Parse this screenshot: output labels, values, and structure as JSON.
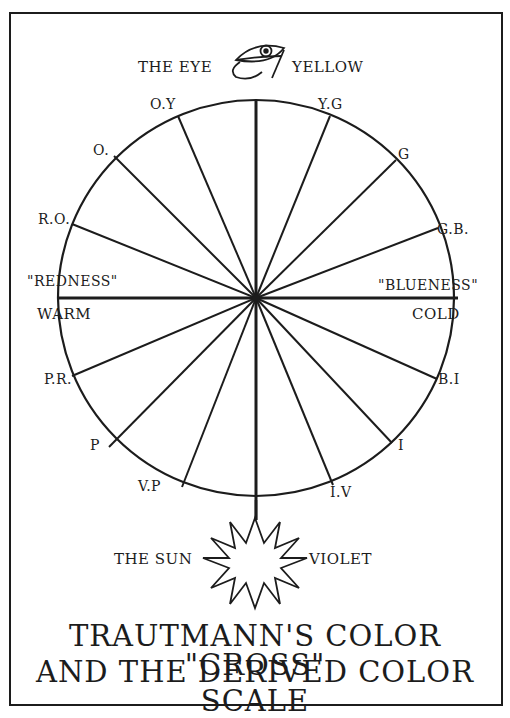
{
  "figure": {
    "type": "color-wheel-diagram",
    "title_line1": "TRAUTMANN'S COLOR \"CROSS\"",
    "title_line2": "AND THE DERIVED COLOR SCALE",
    "top_left_label": "THE EYE",
    "top_right_label": "YELLOW",
    "bottom_left_label": "THE SUN",
    "bottom_right_label": "VIOLET",
    "left_axis_quote": "\"REDNESS\"",
    "left_axis_label": "WARM",
    "right_axis_quote": "\"BLUENESS\"",
    "right_axis_label": "COLD",
    "spoke_labels": {
      "oy": "O.Y",
      "o": "O.",
      "ro": "R.O.",
      "pr": "P.R.",
      "p": "P",
      "vp": "V.P",
      "yg": "Y.G",
      "g": "G",
      "gb": "G.B.",
      "bi": "B.I",
      "i": "I",
      "iv": "I.V"
    },
    "colors": {
      "ink": "#1c1c1c",
      "paper": "#ffffff"
    }
  }
}
